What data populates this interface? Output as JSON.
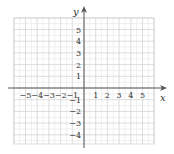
{
  "chart_data": {
    "type": "coordinate-grid",
    "title": "",
    "xlabel": "x",
    "ylabel": "y",
    "xlim": [
      -6,
      6
    ],
    "ylim": [
      -5,
      6
    ],
    "grid": true,
    "x_tick_labels": [
      "-5",
      "-4",
      "-3",
      "-2",
      "-1",
      "1",
      "2",
      "3",
      "4",
      "5"
    ],
    "y_tick_labels": [
      "5",
      "4",
      "3",
      "2",
      "1",
      "-1",
      "-2",
      "-3",
      "-4"
    ],
    "series": []
  },
  "axes": {
    "x_label": "x",
    "y_label": "y"
  },
  "colors": {
    "grid_major": "#d4d4d4",
    "grid_minor": "#ececec",
    "axis": "#555555",
    "text": "#333333"
  }
}
